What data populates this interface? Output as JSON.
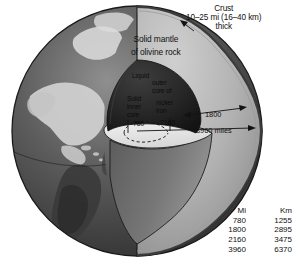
{
  "figure": {
    "background": "#ffffff"
  },
  "labels": {
    "crust": {
      "line1": "Crust",
      "line2": "10–25 mi (16–40 km)",
      "line3": "thick"
    },
    "mantle": {
      "line1": "Solid mantle",
      "line2": "of olivine rock"
    },
    "outer_core": {
      "line1": "Liquid",
      "line2": "outer",
      "line3": "core of",
      "line4": "nickel",
      "line5": "iron"
    },
    "inner_core": {
      "line1": "Solid",
      "line2": "inner",
      "line3": "core"
    }
  },
  "callouts": {
    "inner_core_radius": "780",
    "outer_core_radius": "2160",
    "mantle_depth": "1800",
    "earth_radius": "3960 miles"
  },
  "conversion_table": {
    "headers": [
      "Mi",
      "Km"
    ],
    "rows": [
      {
        "mi": "780",
        "km": "1255"
      },
      {
        "mi": "1800",
        "km": "2895"
      },
      {
        "mi": "2160",
        "km": "3475"
      },
      {
        "mi": "3960",
        "km": "6370"
      }
    ]
  },
  "colors": {
    "ocean_dark": "#4a4a4a",
    "land_light": "#d2d2d2",
    "mantle_face": "#b4b4b4",
    "mantle_shadow": "#6e6e6e",
    "core_dark": "#2a2a2a",
    "cut_plane": "#e8e8e8",
    "crust_rim": "#3a3a3a",
    "ink": "#111111"
  }
}
